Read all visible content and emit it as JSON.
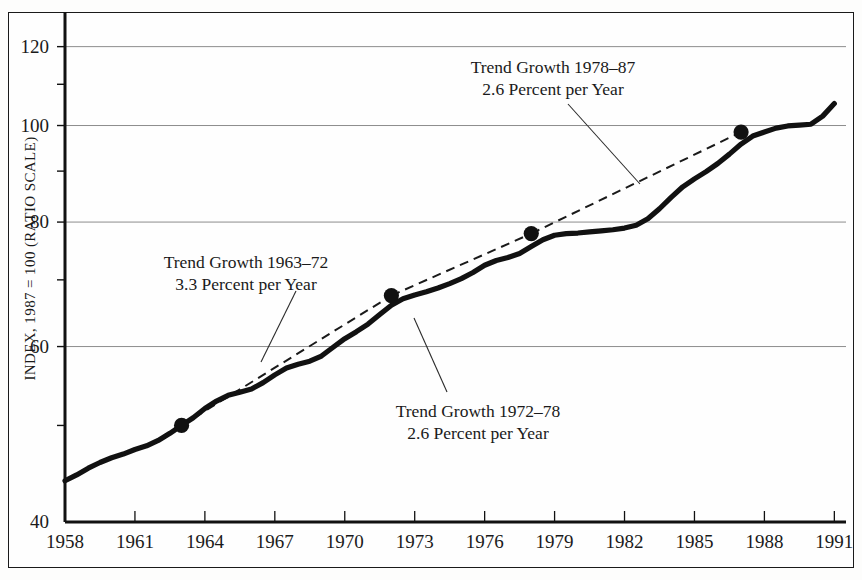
{
  "chart_data": {
    "type": "line",
    "title": "",
    "xlabel": "",
    "ylabel": "INDEX, 1987 = 100 (RATIO SCALE)",
    "scale": "log",
    "grid": true,
    "legend": "none",
    "xlim": [
      1958,
      1991.5
    ],
    "ylim": [
      40,
      130
    ],
    "xticks": [
      "1958",
      "1961",
      "1964",
      "1967",
      "1970",
      "1973",
      "1976",
      "1979",
      "1982",
      "1985",
      "1988",
      "1991"
    ],
    "ytick_labels": [
      "120",
      "100",
      "80",
      "60",
      "40"
    ],
    "ytick_values": [
      120,
      100,
      80,
      60,
      40
    ],
    "yminor_values": [
      110,
      90,
      70,
      50
    ],
    "series": [
      {
        "name": "Index",
        "x": [
          1958,
          1958.5,
          1959,
          1959.5,
          1960,
          1960.5,
          1961,
          1961.5,
          1962,
          1962.5,
          1963,
          1963.5,
          1964,
          1964.5,
          1965,
          1965.5,
          1966,
          1966.5,
          1967,
          1967.5,
          1968,
          1968.5,
          1969,
          1969.5,
          1970,
          1970.5,
          1971,
          1971.5,
          1972,
          1972.5,
          1973,
          1973.5,
          1974,
          1974.5,
          1975,
          1975.5,
          1976,
          1976.5,
          1977,
          1977.5,
          1978,
          1978.5,
          1979,
          1979.5,
          1980,
          1980.5,
          1981,
          1981.5,
          1982,
          1982.5,
          1983,
          1983.5,
          1984,
          1984.5,
          1985,
          1985.5,
          1986,
          1986.5,
          1987,
          1987.5,
          1988,
          1988.5,
          1989,
          1989.5,
          1990,
          1990.5,
          1991
        ],
        "y": [
          44.0,
          44.6,
          45.3,
          45.9,
          46.4,
          46.8,
          47.3,
          47.7,
          48.3,
          49.1,
          50.0,
          50.9,
          52.0,
          52.9,
          53.6,
          54.0,
          54.4,
          55.2,
          56.2,
          57.1,
          57.6,
          58.0,
          58.7,
          59.9,
          61.1,
          62.1,
          63.2,
          64.6,
          66.0,
          67.0,
          67.6,
          68.1,
          68.7,
          69.4,
          70.2,
          71.2,
          72.4,
          73.2,
          73.7,
          74.4,
          75.6,
          76.8,
          77.6,
          77.9,
          78.0,
          78.2,
          78.4,
          78.6,
          78.9,
          79.4,
          80.6,
          82.5,
          84.7,
          86.8,
          88.4,
          89.9,
          91.6,
          93.6,
          95.8,
          97.6,
          98.5,
          99.4,
          99.9,
          100.1,
          100.3,
          102.2,
          105.2
        ]
      }
    ],
    "markers": [
      {
        "x": 1963,
        "y": 50.0,
        "label": "1963 breakpoint"
      },
      {
        "x": 1972,
        "y": 67.5,
        "label": "1972 breakpoint"
      },
      {
        "x": 1978,
        "y": 77.9,
        "label": "1978 breakpoint"
      },
      {
        "x": 1987,
        "y": 98.5,
        "label": "1987 breakpoint"
      }
    ],
    "trend_lines": [
      {
        "name": "Trend Growth 1963-72",
        "rate": 3.3,
        "x0": 1963,
        "y0": 50.0,
        "x1": 1972,
        "y1": 67.5,
        "style": "dashed"
      },
      {
        "name": "Trend Growth 1972-78",
        "rate": 2.6,
        "x0": 1972,
        "y0": 67.5,
        "x1": 1978,
        "y1": 77.9,
        "style": "dashed"
      },
      {
        "name": "Trend Growth 1978-87",
        "rate": 2.6,
        "x0": 1978,
        "y0": 77.9,
        "x1": 1987,
        "y1": 98.5,
        "style": "dashed"
      }
    ],
    "annotations": [
      {
        "id": "a1963",
        "line1": "Trend Growth 1963–72",
        "line2": "3.3 Percent per Year",
        "text_x": 246,
        "text_y": 251,
        "leader": {
          "x1": 296,
          "y1": 291,
          "x2": 261,
          "y2": 362
        }
      },
      {
        "id": "a1978",
        "line1": "Trend Growth 1978–87",
        "line2": "2.6 Percent per Year",
        "text_x": 553,
        "text_y": 56,
        "leader": {
          "x1": 568,
          "y1": 104,
          "x2": 640,
          "y2": 184
        }
      },
      {
        "id": "a1972",
        "line1": "Trend Growth 1972–78",
        "line2": "2.6 Percent per Year",
        "text_x": 478,
        "text_y": 400,
        "leader": {
          "x1": 447,
          "y1": 392,
          "x2": 414,
          "y2": 318
        }
      }
    ]
  },
  "style": {
    "line_color": "#111111",
    "trend_color": "#1a1a1a",
    "grid_color": "#8d8d8d",
    "axis_color": "#111111",
    "background": "#fefefe"
  }
}
